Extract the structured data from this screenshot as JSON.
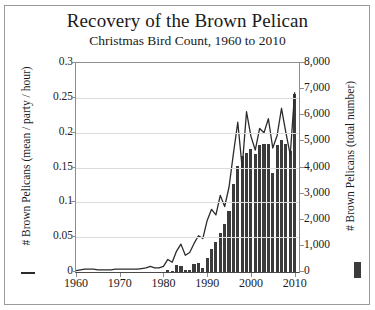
{
  "chart_data": {
    "type": "bar",
    "title": "Recovery of the Brown Pelican",
    "subtitle": "Christmas Bird Count, 1960 to 2010",
    "xlabel": "",
    "ylabel": "# Brown Pelicans (mean / party / hour)",
    "ylabel_right": "# Brown Pelicans (total number)",
    "xlim": [
      1960,
      2011
    ],
    "ylim": [
      0,
      0.3
    ],
    "ylim_right": [
      0,
      8000
    ],
    "grid": true,
    "legend_position": "outside-left-and-right",
    "xticks": [
      "1960",
      "1970",
      "1980",
      "1990",
      "2000",
      "2010"
    ],
    "xtick_values": [
      1960,
      1970,
      1980,
      1990,
      2000,
      2010
    ],
    "yticks_left": [
      "0",
      "0.05",
      "0.1",
      "0.15",
      "0.2",
      "0.25",
      "0.3"
    ],
    "ytick_values_left": [
      0,
      0.05,
      0.1,
      0.15,
      0.2,
      0.25,
      0.3
    ],
    "yticks_right": [
      "0",
      "1,000",
      "2,000",
      "3,000",
      "4,000",
      "5,000",
      "6,000",
      "7,000",
      "8,000"
    ],
    "ytick_values_right": [
      0,
      1000,
      2000,
      3000,
      4000,
      5000,
      6000,
      7000,
      8000
    ],
    "x": [
      1960,
      1961,
      1962,
      1963,
      1964,
      1965,
      1966,
      1967,
      1968,
      1969,
      1970,
      1971,
      1972,
      1973,
      1974,
      1975,
      1976,
      1977,
      1978,
      1979,
      1980,
      1981,
      1982,
      1983,
      1984,
      1985,
      1986,
      1987,
      1988,
      1989,
      1990,
      1991,
      1992,
      1993,
      1994,
      1995,
      1996,
      1997,
      1998,
      1999,
      2000,
      2001,
      2002,
      2003,
      2004,
      2005,
      2006,
      2007,
      2008,
      2009,
      2010
    ],
    "series": [
      {
        "name": "# Brown Pelicans (mean / party / hour)",
        "type": "line",
        "axis": "left",
        "color": "#2b2b2b",
        "values": [
          0.002,
          0.003,
          0.004,
          0.004,
          0.004,
          0.003,
          0.003,
          0.003,
          0.003,
          0.004,
          0.004,
          0.004,
          0.004,
          0.004,
          0.004,
          0.005,
          0.006,
          0.008,
          0.006,
          0.006,
          0.008,
          0.018,
          0.014,
          0.03,
          0.04,
          0.024,
          0.028,
          0.041,
          0.052,
          0.048,
          0.074,
          0.09,
          0.082,
          0.11,
          0.094,
          0.122,
          0.17,
          0.215,
          0.15,
          0.23,
          0.195,
          0.175,
          0.206,
          0.2,
          0.22,
          0.178,
          0.196,
          0.235,
          0.2,
          0.168,
          0.258
        ]
      },
      {
        "name": "# Brown Pelicans (total number)",
        "type": "bar",
        "axis": "right",
        "color": "#3b3b3b",
        "values": [
          0,
          0,
          0,
          0,
          0,
          0,
          0,
          0,
          0,
          0,
          0,
          0,
          0,
          0,
          0,
          0,
          0,
          0,
          0,
          0,
          0,
          60,
          40,
          250,
          220,
          60,
          80,
          300,
          340,
          170,
          520,
          900,
          1150,
          1500,
          1850,
          2350,
          3350,
          4050,
          4450,
          4550,
          4700,
          4500,
          4850,
          4900,
          4900,
          3800,
          4850,
          5050,
          4900,
          4650,
          6800
        ]
      }
    ]
  },
  "legend": {
    "left_marker": "line-marker",
    "right_marker": "bar-marker"
  }
}
